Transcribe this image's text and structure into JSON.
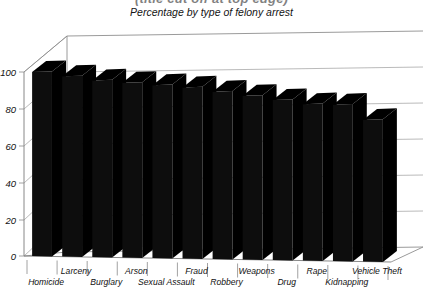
{
  "chart_data": {
    "type": "bar",
    "title": "Percentage by type of felony arrest",
    "title_cropped": "(title cut off at top edge)",
    "xlabel": "",
    "ylabel": "",
    "ylim": [
      0,
      100
    ],
    "yticks": [
      0,
      20,
      40,
      60,
      80,
      100
    ],
    "grid": true,
    "legend": "none",
    "style": "3d-column",
    "bar_color": "#000000",
    "categories": [
      "Homicide",
      "Larceny",
      "Burglary",
      "Arson",
      "Sexual Assault",
      "Fraud",
      "Robbery",
      "Weapons",
      "Drug",
      "Rape",
      "Kidnapping",
      "Vehicle Theft"
    ],
    "values": [
      100,
      98,
      96,
      95,
      94,
      93,
      91,
      89,
      87,
      85,
      85,
      77
    ]
  },
  "axis": {
    "y_ticks": [
      "100",
      "80",
      "60",
      "40",
      "20",
      "0"
    ],
    "x_labels_upper": [
      "Larceny",
      "Arson",
      "Fraud",
      "Weapons",
      "Rape",
      "Vehicle Theft"
    ],
    "x_labels_lower": [
      "Homicide",
      "Burglary",
      "Sexual Assault",
      "Robbery",
      "Drug",
      "Kidnapping"
    ]
  },
  "colors": {
    "bar": "#0d0d0d",
    "bar_side": "#000000",
    "grid": "#9a9a9a",
    "axis": "#6e6e6e",
    "text": "#111111",
    "background": "#ffffff"
  }
}
